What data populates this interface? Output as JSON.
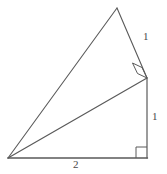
{
  "figure": {
    "background_color": "#ffffff",
    "stroke_color": "#5a5a5a",
    "stroke_width": 1,
    "points": {
      "left_vertex": {
        "name": "A",
        "x": 8,
        "y": 158
      },
      "bottom_right_vertex": {
        "name": "B",
        "x": 147,
        "y": 158
      },
      "right_corner_vertex": {
        "name": "C",
        "x": 147,
        "y": 78
      },
      "apex_vertex": {
        "name": "D",
        "x": 117,
        "y": 8
      }
    },
    "segments": [
      {
        "name": "base",
        "from": "A",
        "to": "B",
        "length_label": "2"
      },
      {
        "name": "vertical-right",
        "from": "B",
        "to": "C",
        "length_label": "1"
      },
      {
        "name": "hypotenuse-inner",
        "from": "A",
        "to": "C",
        "length_label": ""
      },
      {
        "name": "upper-right-side",
        "from": "C",
        "to": "D",
        "length_label": "1"
      },
      {
        "name": "long-left-side",
        "from": "A",
        "to": "D",
        "length_label": ""
      }
    ],
    "right_angle_marks": [
      {
        "name": "right-angle-bottom-right",
        "at_vertex": "B",
        "size": 11,
        "rotation_deg": 0
      },
      {
        "name": "right-angle-upper-corner",
        "at_vertex": "C",
        "size": 11,
        "rotation_deg": -30
      }
    ],
    "labels": {
      "side_upper": "1",
      "side_lower": "1",
      "side_base": "2"
    }
  }
}
